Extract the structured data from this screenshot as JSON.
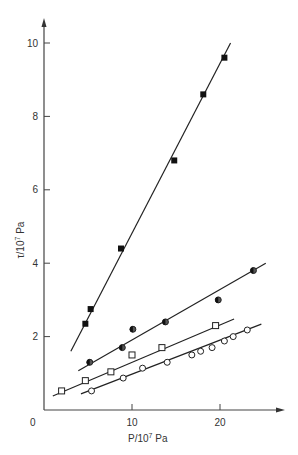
{
  "chart_data": {
    "type": "scatter",
    "title": "",
    "xlabel": "P/10^7 Pa",
    "ylabel": "τ/10^7 Pa",
    "xlabel_main": "P/10",
    "xlabel_exp": "7",
    "xlabel_unit": " Pa",
    "ylabel_main": "τ/10",
    "ylabel_exp": "7",
    "ylabel_unit": " Pa",
    "xlim": [
      0,
      27
    ],
    "ylim": [
      0,
      10.6
    ],
    "x_ticks": [
      10,
      20
    ],
    "x_tick_labels": [
      "0",
      "10",
      "20"
    ],
    "y_ticks": [
      2,
      4,
      6,
      8,
      10
    ],
    "y_tick_labels": [
      "2",
      "4",
      "6",
      "8",
      "10"
    ],
    "grid": false,
    "legend": "none",
    "series": [
      {
        "name": "filled squares",
        "marker": "filled-square",
        "points": [
          [
            4.7,
            2.35
          ],
          [
            5.3,
            2.75
          ],
          [
            8.75,
            4.4
          ],
          [
            14.8,
            6.8
          ],
          [
            18.1,
            8.6
          ],
          [
            20.5,
            9.6
          ]
        ],
        "fit_line": [
          [
            3.05,
            1.6
          ],
          [
            21.2,
            10.0
          ]
        ]
      },
      {
        "name": "half-filled circles",
        "marker": "half-filled-circle",
        "points": [
          [
            5.2,
            1.3
          ],
          [
            8.9,
            1.7
          ],
          [
            10.1,
            2.2
          ],
          [
            13.8,
            2.4
          ],
          [
            19.8,
            3.0
          ],
          [
            23.8,
            3.8
          ]
        ],
        "fit_line": [
          [
            3.9,
            1.07
          ],
          [
            25.2,
            4.0
          ]
        ]
      },
      {
        "name": "open squares",
        "marker": "open-square",
        "points": [
          [
            2.0,
            0.52
          ],
          [
            4.7,
            0.8
          ],
          [
            7.6,
            1.04
          ],
          [
            10.0,
            1.5
          ],
          [
            13.4,
            1.7
          ],
          [
            19.5,
            2.3
          ]
        ],
        "fit_line": [
          [
            1.0,
            0.38
          ],
          [
            21.6,
            2.48
          ]
        ]
      },
      {
        "name": "open circles",
        "marker": "open-circle",
        "points": [
          [
            5.4,
            0.52
          ],
          [
            9.0,
            0.87
          ],
          [
            11.2,
            1.14
          ],
          [
            14.0,
            1.3
          ],
          [
            16.8,
            1.5
          ],
          [
            17.8,
            1.6
          ],
          [
            19.1,
            1.7
          ],
          [
            20.5,
            1.88
          ],
          [
            21.5,
            2.0
          ],
          [
            23.1,
            2.18
          ]
        ],
        "fit_line": [
          [
            4.2,
            0.44
          ],
          [
            24.7,
            2.34
          ]
        ]
      }
    ]
  }
}
